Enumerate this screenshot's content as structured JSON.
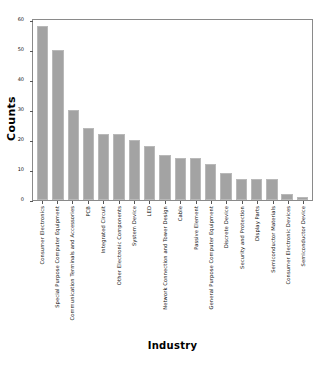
{
  "chart_data": {
    "type": "bar",
    "title": "",
    "xlabel": "Industry",
    "ylabel": "Counts",
    "ylim": [
      0,
      60
    ],
    "yticks": [
      0,
      10,
      20,
      30,
      40,
      50,
      60
    ],
    "grid": false,
    "legend": null,
    "bar_color": "#a3a3a3",
    "categories": [
      "Consumer Electronics",
      "Special Purpose Computer Equipment",
      "Communication Terminals and Accessories",
      "PCB",
      "Integrated Circuit",
      "Other Electronic Components",
      "System Device",
      "LED",
      "Network Connection and Tower Design",
      "Cable",
      "Passive Element",
      "General Purpose Computer Equipment",
      "Discrete Device",
      "Security and Protection",
      "Display Parts",
      "Semiconductor Materials",
      "Consumer Electronic Devices",
      "Semiconductor Device"
    ],
    "values": [
      58,
      50,
      30,
      24,
      22,
      22,
      20,
      18,
      15,
      14,
      14,
      12,
      9,
      7,
      7,
      7,
      2,
      1
    ]
  }
}
